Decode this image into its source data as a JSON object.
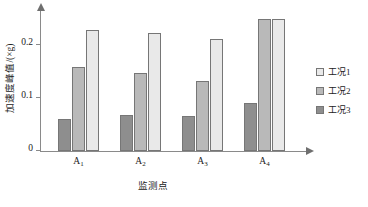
{
  "chart_data": {
    "type": "bar",
    "title": "",
    "xlabel": "监测点",
    "ylabel": "加速度峰值/(×g)",
    "categories": [
      "A₁",
      "A₂",
      "A₃",
      "A₄"
    ],
    "category_bases": [
      "A",
      "A",
      "A",
      "A"
    ],
    "category_subs": [
      "1",
      "2",
      "3",
      "4"
    ],
    "series": [
      {
        "name": "工况1",
        "values": [
          0.228,
          0.222,
          0.21,
          0.249
        ],
        "color": "#e9e9e9"
      },
      {
        "name": "工况2",
        "values": [
          0.157,
          0.146,
          0.132,
          0.249
        ],
        "color": "#b9b9b9"
      },
      {
        "name": "工况3",
        "values": [
          0.061,
          0.068,
          0.066,
          0.091
        ],
        "color": "#8e8e8e"
      }
    ],
    "bar_draw_order": [
      "工况3",
      "工况2",
      "工况1"
    ],
    "ylim": [
      0,
      0.265
    ],
    "yticks": [
      0,
      0.1,
      0.2
    ],
    "ytick_labels": [
      "0",
      "0.1",
      "0.2"
    ],
    "grid": false,
    "legend_position": "right",
    "axis_color": "#8a8a8a",
    "bar_border_color": "#767676"
  },
  "legend": {
    "items": [
      {
        "label": "工况1",
        "color": "#e9e9e9"
      },
      {
        "label": "工况2",
        "color": "#b9b9b9"
      },
      {
        "label": "工况3",
        "color": "#8e8e8e"
      }
    ]
  }
}
